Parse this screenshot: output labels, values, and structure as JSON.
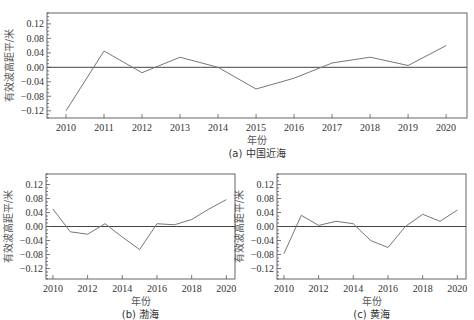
{
  "chart_data": [
    {
      "id": "a",
      "type": "line",
      "title": "(a) 中国近海",
      "xlabel": "年份",
      "ylabel": "有效波高距平/米",
      "x": [
        2010,
        2011,
        2012,
        2013,
        2014,
        2015,
        2016,
        2017,
        2018,
        2019,
        2020
      ],
      "xticks": [
        2010,
        2011,
        2012,
        2013,
        2014,
        2015,
        2016,
        2017,
        2018,
        2019,
        2020
      ],
      "yticks": [
        -0.12,
        -0.08,
        -0.04,
        0.0,
        0.04,
        0.08,
        0.12
      ],
      "yticklabels": [
        "−0.12",
        "−0.08",
        "−0.04",
        "0.00",
        "0.04",
        "0.08",
        "0.12"
      ],
      "ylim": [
        -0.14,
        0.15
      ],
      "xlim": [
        2009.5,
        2020.55
      ],
      "series": [
        {
          "name": "有效波高距平",
          "values": [
            -0.12,
            0.045,
            -0.015,
            0.028,
            0.0,
            -0.06,
            -0.03,
            0.012,
            0.028,
            0.005,
            0.06
          ]
        }
      ],
      "grid": false,
      "reference_line": 0.0,
      "frame": {
        "left": 47,
        "top": 13,
        "right": 467,
        "bottom": 118
      }
    },
    {
      "id": "b",
      "type": "line",
      "title": "(b) 渤海",
      "xlabel": "年份",
      "ylabel": "有效波高距平/米",
      "x": [
        2010,
        2011,
        2012,
        2013,
        2014,
        2015,
        2016,
        2017,
        2018,
        2019,
        2020
      ],
      "xticks": [
        2010,
        2012,
        2014,
        2016,
        2018,
        2020
      ],
      "yticks": [
        -0.12,
        -0.08,
        -0.04,
        0.0,
        0.04,
        0.08,
        0.12
      ],
      "yticklabels": [
        "−0.12",
        "−0.08",
        "−0.04",
        "0.00",
        "0.04",
        "0.08",
        "0.12"
      ],
      "ylim": [
        -0.15,
        0.15
      ],
      "xlim": [
        2009.6,
        2020.5
      ],
      "series": [
        {
          "name": "有效波高距平",
          "values": [
            0.05,
            -0.015,
            -0.022,
            0.008,
            -0.03,
            -0.066,
            0.008,
            0.005,
            0.02,
            0.05,
            0.077
          ]
        }
      ],
      "grid": false,
      "reference_line": 0.0,
      "frame": {
        "left": 46,
        "top": 174,
        "right": 235,
        "bottom": 279
      }
    },
    {
      "id": "c",
      "type": "line",
      "title": "(c) 黄海",
      "xlabel": "年份",
      "ylabel": "有效波高距平/米",
      "x": [
        2010,
        2011,
        2012,
        2013,
        2014,
        2015,
        2016,
        2017,
        2018,
        2019,
        2020
      ],
      "xticks": [
        2010,
        2012,
        2014,
        2016,
        2018,
        2020
      ],
      "yticks": [
        -0.12,
        -0.08,
        -0.04,
        0.0,
        0.04,
        0.08,
        0.12
      ],
      "yticklabels": [
        "−0.12",
        "−0.08",
        "−0.04",
        "0.00",
        "0.04",
        "0.08",
        "0.12"
      ],
      "ylim": [
        -0.15,
        0.15
      ],
      "xlim": [
        2009.6,
        2020.5
      ],
      "series": [
        {
          "name": "有效波高距平",
          "values": [
            -0.078,
            0.032,
            0.003,
            0.015,
            0.008,
            -0.04,
            -0.06,
            0.0,
            0.035,
            0.015,
            0.047
          ]
        }
      ],
      "grid": false,
      "reference_line": 0.0,
      "frame": {
        "left": 277,
        "top": 174,
        "right": 466,
        "bottom": 279
      }
    }
  ]
}
